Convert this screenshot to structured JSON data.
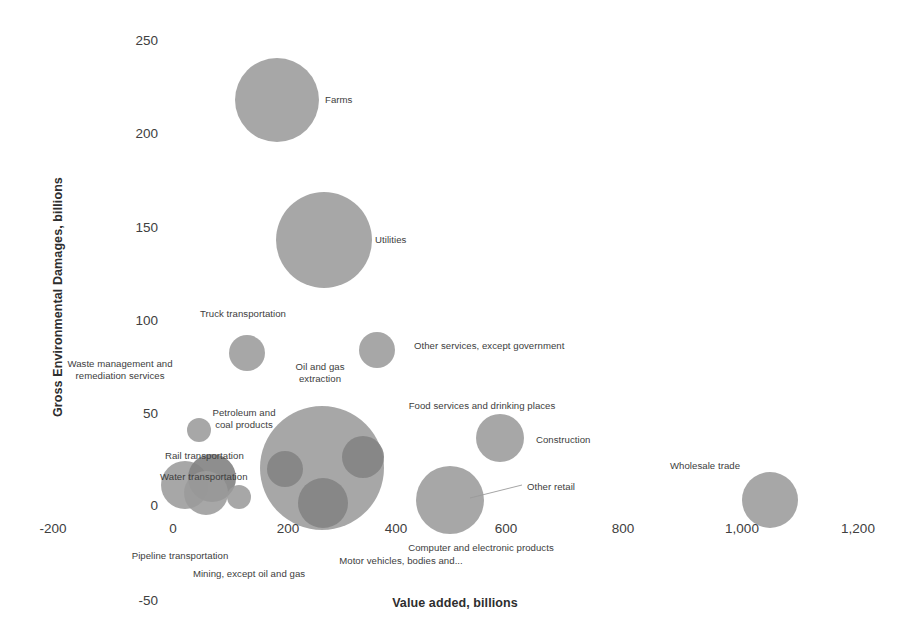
{
  "chart_data": {
    "type": "scatter",
    "title": "",
    "xlabel": "Value added, billions",
    "ylabel": "Gross Environmental Damages, billions",
    "xlim": [
      -200,
      1200
    ],
    "ylim": [
      -50,
      250
    ],
    "xticks": [
      "-200",
      "0",
      "200",
      "400",
      "600",
      "800",
      "1,000",
      "1,200"
    ],
    "yticks": [
      "-50",
      "0",
      "50",
      "100",
      "150",
      "200",
      "250"
    ],
    "grid": false,
    "legend": "none",
    "bubble_color": "#9b9b9b",
    "bubble_color_dark": "#848484",
    "points": [
      {
        "label": "Farms",
        "x": 175,
        "y": 218,
        "size": 42
      },
      {
        "label": "Utilities",
        "x": 260,
        "y": 143,
        "size": 48
      },
      {
        "label": "Truck transportation",
        "x": 130,
        "y": 82,
        "size": 18
      },
      {
        "label": "Oil and gas\nextraction",
        "x": 365,
        "y": 84,
        "size": 18
      },
      {
        "label": "Other services, except government",
        "x": 365,
        "y": 84,
        "size": 18
      },
      {
        "label": "Waste management and\nremediation services",
        "x": 20,
        "y": 60,
        "size": 11
      },
      {
        "label": "Petroleum and\ncoal products",
        "x": 38,
        "y": 45,
        "size": 11
      },
      {
        "label": "Rail transportation",
        "x": 35,
        "y": 10,
        "size": 22
      },
      {
        "label": "Water transportation",
        "x": 12,
        "y": 6,
        "size": 25
      },
      {
        "label": "Pipeline transportation",
        "x": 105,
        "y": 2,
        "size": 12
      },
      {
        "label": "Mining, except oil and gas",
        "x": 210,
        "y": 20,
        "size": 62
      },
      {
        "label": "Motor vehicles, bodies and...",
        "x": 270,
        "y": 12,
        "size": 24
      },
      {
        "label": "Computer and electronic products",
        "x": 435,
        "y": 3,
        "size": 33
      },
      {
        "label": "Food services and drinking places",
        "x": 520,
        "y": 36,
        "size": 24
      },
      {
        "label": "Construction",
        "x": 520,
        "y": 36,
        "size": 24
      },
      {
        "label": "Other retail",
        "x": 435,
        "y": 3,
        "size": 33
      },
      {
        "label": "Wholesale trade",
        "x": 1005,
        "y": 2,
        "size": 28
      }
    ],
    "annotations": [
      {
        "text": "Farms",
        "anchor": "right"
      },
      {
        "text": "Utilities",
        "anchor": "right"
      },
      {
        "text": "Truck transportation",
        "anchor": "center"
      },
      {
        "text": "Oil and gas\nextraction",
        "anchor": "center"
      },
      {
        "text": "Other services, except government",
        "anchor": "right"
      },
      {
        "text": "Waste management and\nremediation services",
        "anchor": "center"
      },
      {
        "text": "Petroleum and\ncoal products",
        "anchor": "center"
      },
      {
        "text": "Rail transportation",
        "anchor": "right"
      },
      {
        "text": "Water transportation",
        "anchor": "right"
      },
      {
        "text": "Pipeline transportation",
        "anchor": "center"
      },
      {
        "text": "Mining, except oil and gas",
        "anchor": "center"
      },
      {
        "text": "Motor vehicles, bodies and...",
        "anchor": "center"
      },
      {
        "text": "Computer and electronic products",
        "anchor": "center"
      },
      {
        "text": "Food services and drinking places",
        "anchor": "center"
      },
      {
        "text": "Construction",
        "anchor": "right"
      },
      {
        "text": "Other retail",
        "anchor": "right"
      },
      {
        "text": "Wholesale trade",
        "anchor": "center"
      }
    ]
  },
  "axes": {
    "x_title": "Value added, billions",
    "y_title": "Gross Environmental Damages, billions",
    "x_ticks": [
      {
        "label": "-200",
        "px": 53
      },
      {
        "label": "0",
        "px": 173
      },
      {
        "label": "200",
        "px": 288
      },
      {
        "label": "400",
        "px": 396
      },
      {
        "label": "600",
        "px": 506
      },
      {
        "label": "800",
        "px": 623
      },
      {
        "label": "1,000",
        "px": 742
      },
      {
        "label": "1,200",
        "px": 858
      }
    ],
    "y_ticks": [
      {
        "label": "250",
        "px": 40
      },
      {
        "label": "200",
        "px": 133
      },
      {
        "label": "150",
        "px": 227
      },
      {
        "label": "100",
        "px": 320
      },
      {
        "label": "50",
        "px": 413
      },
      {
        "label": "0",
        "px": 505
      },
      {
        "label": "-50",
        "px": 600
      }
    ]
  },
  "bubbles": [
    {
      "name": "farms",
      "cx": 277,
      "cy": 100,
      "r": 42,
      "shade": "light"
    },
    {
      "name": "utilities",
      "cx": 324,
      "cy": 240,
      "r": 48,
      "shade": "light"
    },
    {
      "name": "truck-transportation",
      "cx": 247,
      "cy": 353,
      "r": 18,
      "shade": "light"
    },
    {
      "name": "other-services",
      "cx": 377,
      "cy": 350,
      "r": 18,
      "shade": "light"
    },
    {
      "name": "petroleum-and-coal-products",
      "cx": 199,
      "cy": 430,
      "r": 12,
      "shade": "light"
    },
    {
      "name": "water-transportation",
      "cx": 185,
      "cy": 485,
      "r": 24,
      "shade": "light"
    },
    {
      "name": "rail-transportation",
      "cx": 212,
      "cy": 478,
      "r": 24,
      "shade": "dark"
    },
    {
      "name": "waste-management",
      "cx": 206,
      "cy": 493,
      "r": 22,
      "shade": "light"
    },
    {
      "name": "pipeline-transportation",
      "cx": 239,
      "cy": 497,
      "r": 12,
      "shade": "light"
    },
    {
      "name": "mining-except-oil-and-gas",
      "cx": 322,
      "cy": 468,
      "r": 62,
      "shade": "light"
    },
    {
      "name": "inner-bubble-left",
      "cx": 285,
      "cy": 469,
      "r": 18,
      "shade": "dark"
    },
    {
      "name": "inner-bubble-right",
      "cx": 363,
      "cy": 457,
      "r": 21,
      "shade": "dark"
    },
    {
      "name": "motor-vehicles",
      "cx": 323,
      "cy": 503,
      "r": 25,
      "shade": "dark"
    },
    {
      "name": "computer-and-electronic",
      "cx": 450,
      "cy": 500,
      "r": 34,
      "shade": "light"
    },
    {
      "name": "food-services",
      "cx": 500,
      "cy": 438,
      "r": 24,
      "shade": "light"
    },
    {
      "name": "wholesale-trade",
      "cx": 770,
      "cy": 500,
      "r": 28,
      "shade": "light"
    }
  ],
  "labels": [
    {
      "name": "label-farms",
      "text": "Farms",
      "x": 325,
      "y": 100,
      "align": "right"
    },
    {
      "name": "label-utilities",
      "text": "Utilities",
      "x": 375,
      "y": 240,
      "align": "right"
    },
    {
      "name": "label-truck-transportation",
      "text": "Truck transportation",
      "x": 243,
      "y": 314,
      "align": "center"
    },
    {
      "name": "label-oil-and-gas",
      "text": "Oil and gas\nextraction",
      "x": 320,
      "y": 372,
      "align": "center"
    },
    {
      "name": "label-other-services",
      "text": "Other services, except government",
      "x": 414,
      "y": 346,
      "align": "right"
    },
    {
      "name": "label-waste-management",
      "text": "Waste management and\nremediation services",
      "x": 120,
      "y": 369,
      "align": "center"
    },
    {
      "name": "label-petroleum",
      "text": "Petroleum and\ncoal products",
      "x": 244,
      "y": 418,
      "align": "center"
    },
    {
      "name": "label-rail-transportation",
      "text": "Rail transportation",
      "x": 165,
      "y": 456,
      "align": "right"
    },
    {
      "name": "label-water-transportation",
      "text": "Water transportation",
      "x": 160,
      "y": 477,
      "align": "right"
    },
    {
      "name": "label-pipeline",
      "text": "Pipeline transportation",
      "x": 180,
      "y": 556,
      "align": "center"
    },
    {
      "name": "label-mining",
      "text": "Mining, except oil and gas",
      "x": 249,
      "y": 574,
      "align": "center"
    },
    {
      "name": "label-motor-vehicles",
      "text": "Motor vehicles, bodies and...",
      "x": 401,
      "y": 561,
      "align": "center"
    },
    {
      "name": "label-computer-electronic",
      "text": "Computer and electronic products",
      "x": 481,
      "y": 548,
      "align": "center"
    },
    {
      "name": "label-food-services",
      "text": "Food services and drinking places",
      "x": 482,
      "y": 406,
      "align": "center"
    },
    {
      "name": "label-construction",
      "text": "Construction",
      "x": 536,
      "y": 440,
      "align": "right"
    },
    {
      "name": "label-other-retail",
      "text": "Other retail",
      "x": 527,
      "y": 487,
      "align": "right"
    },
    {
      "name": "label-wholesale-trade",
      "text": "Wholesale trade",
      "x": 705,
      "y": 466,
      "align": "center"
    }
  ],
  "leader_lines": [
    {
      "name": "leader-other-retail",
      "x1": 470,
      "y1": 498,
      "x2": 522,
      "y2": 485
    }
  ]
}
